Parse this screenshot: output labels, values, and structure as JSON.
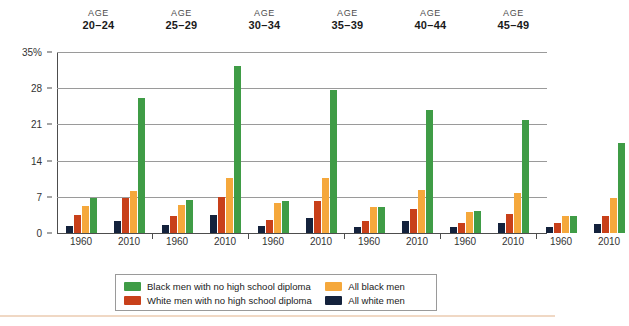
{
  "chart_data": {
    "type": "bar",
    "title": "",
    "xlabel": "",
    "ylabel": "",
    "ylim": [
      0,
      35
    ],
    "yticks": [
      "0",
      "7",
      "14",
      "21",
      "28",
      "35%"
    ],
    "ytick_values": [
      0,
      7,
      14,
      21,
      28,
      35
    ],
    "grid": true,
    "legend_position": "bottom",
    "group_label_prefix": "AGE",
    "groups": [
      "20–24",
      "25–29",
      "30–34",
      "35–39",
      "40–44",
      "45–49"
    ],
    "x": [
      "1960",
      "2010"
    ],
    "series": [
      {
        "name": "All white men",
        "color": "#14223c",
        "values_1960": [
          1.4,
          1.5,
          1.3,
          1.2,
          1.2,
          1.2
        ],
        "values_2010": [
          2.4,
          3.4,
          2.9,
          2.3,
          2.0,
          1.8
        ]
      },
      {
        "name": "White men with no high school diploma",
        "color": "#c8401a",
        "values_1960": [
          3.4,
          3.3,
          2.6,
          2.3,
          2.0,
          1.9
        ],
        "values_2010": [
          6.8,
          7.0,
          6.2,
          4.6,
          3.7,
          3.2
        ]
      },
      {
        "name": "All black men",
        "color": "#f5a83c",
        "values_1960": [
          5.2,
          5.4,
          5.8,
          5.0,
          4.0,
          3.3
        ],
        "values_2010": [
          8.2,
          10.7,
          10.7,
          8.3,
          7.7,
          6.8
        ]
      },
      {
        "name": "Black men with no high school diploma",
        "color": "#3f9c46",
        "values_1960": [
          6.8,
          6.3,
          6.2,
          5.0,
          4.2,
          3.3
        ],
        "values_2010": [
          26.2,
          32.3,
          27.6,
          23.8,
          21.8,
          17.5
        ]
      }
    ]
  },
  "axis": {
    "ytick_labels": [
      "35%",
      "28",
      "21",
      "14",
      "7",
      "0"
    ],
    "xtick_labels": [
      "1960",
      "2010"
    ]
  },
  "legend": {
    "items": [
      {
        "label": "Black men with no high school diploma",
        "color": "#3f9c46",
        "swatch_name": "legend-swatch-black-no-diploma"
      },
      {
        "label": "All black men",
        "color": "#f5a83c",
        "swatch_name": "legend-swatch-all-black"
      },
      {
        "label": "White men with no high school diploma",
        "color": "#c8401a",
        "swatch_name": "legend-swatch-white-no-diploma"
      },
      {
        "label": "All white men",
        "color": "#14223c",
        "swatch_name": "legend-swatch-all-white"
      }
    ]
  }
}
